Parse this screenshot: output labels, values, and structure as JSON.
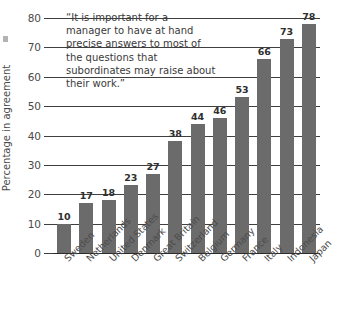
{
  "chart_data": {
    "type": "bar",
    "title": "",
    "subtitle": "",
    "annotation": "“It is important for a manager to have at hand precise answers to most of the questions that subordinates may raise about their work.”",
    "xlabel": "",
    "ylabel": "Percentage in agreement",
    "ylim": [
      0,
      80
    ],
    "ytick_values": [
      0,
      10,
      20,
      30,
      40,
      50,
      60,
      70,
      80
    ],
    "ytick_labels": [
      "0",
      "10",
      "20",
      "30",
      "40",
      "50",
      "60",
      "70",
      "80"
    ],
    "grid": true,
    "legend": "none",
    "bar_color": "#6b6b6b",
    "categories": [
      "Sweden",
      "Netherlands",
      "United States",
      "Denmark",
      "Great Britain",
      "Switzerland",
      "Belgium",
      "Germany",
      "France",
      "Italy",
      "Indonesia",
      "Japan"
    ],
    "values": [
      10,
      17,
      18,
      23,
      27,
      38,
      44,
      46,
      53,
      66,
      73,
      78
    ],
    "value_labels": [
      "10",
      "17",
      "18",
      "23",
      "27",
      "38",
      "44",
      "46",
      "53",
      "66",
      "73",
      "78"
    ]
  }
}
